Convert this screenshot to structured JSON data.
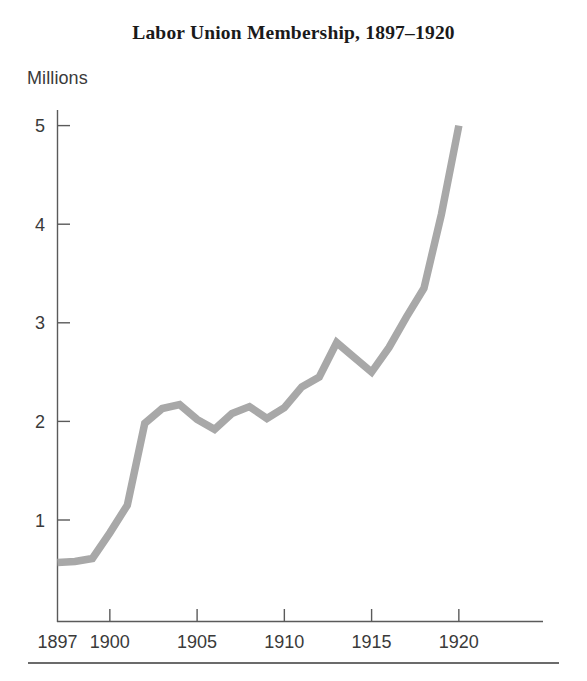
{
  "figure": {
    "title": "Labor Union Membership, 1897–1920",
    "y_axis_caption": "Millions"
  },
  "chart_data": {
    "type": "line",
    "title": "Labor Union Membership, 1897–1920",
    "xlabel": "",
    "ylabel": "Millions",
    "xlim": [
      1897,
      1923
    ],
    "ylim": [
      0,
      5.4
    ],
    "grid": false,
    "legend": "none",
    "line_color": "#a8a8a8",
    "x_tick_labels": [
      "1897",
      "1900",
      "1905",
      "1910",
      "1915",
      "1920"
    ],
    "x_ticks": [
      1897,
      1900,
      1905,
      1910,
      1915,
      1920
    ],
    "y_tick_labels": [
      "1",
      "2",
      "3",
      "4",
      "5"
    ],
    "y_ticks": [
      1,
      2,
      3,
      4,
      5
    ],
    "x": [
      1897,
      1898,
      1899,
      1900,
      1901,
      1902,
      1903,
      1904,
      1905,
      1906,
      1907,
      1908,
      1909,
      1910,
      1911,
      1912,
      1913,
      1914,
      1915,
      1916,
      1917,
      1918,
      1919,
      1920
    ],
    "values": [
      0.57,
      0.58,
      0.61,
      0.87,
      1.15,
      1.98,
      2.13,
      2.17,
      2.02,
      1.92,
      2.08,
      2.15,
      2.03,
      2.14,
      2.35,
      2.45,
      2.8,
      2.65,
      2.5,
      2.75,
      3.06,
      3.35,
      4.1,
      5.0
    ],
    "series": [
      {
        "name": "Labor union membership (millions)",
        "values": [
          0.57,
          0.58,
          0.61,
          0.87,
          1.15,
          1.98,
          2.13,
          2.17,
          2.02,
          1.92,
          2.08,
          2.15,
          2.03,
          2.14,
          2.35,
          2.45,
          2.8,
          2.65,
          2.5,
          2.75,
          3.06,
          3.35,
          4.1,
          5.0
        ]
      }
    ]
  }
}
